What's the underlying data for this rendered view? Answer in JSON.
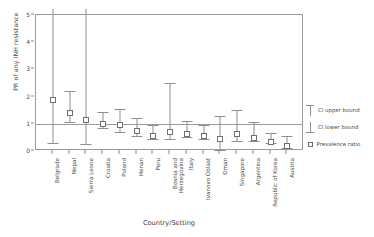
{
  "chart_data": {
    "type": "scatter",
    "title": "",
    "xlabel": "Country/Setting",
    "ylabel": "PR of any INH resistance",
    "ylim": [
      0,
      5
    ],
    "yticks": [
      0,
      1,
      2,
      3,
      4,
      5
    ],
    "grid": false,
    "reference_line": 1,
    "legend_position": "right",
    "categories": [
      "Belgrade",
      "Nepal",
      "Sierra Leone",
      "Croatia",
      "Poland",
      "Henan",
      "Peru",
      "Bosnia and Herzegovina",
      "Italy",
      "Ivanovo Oblast",
      "Oman",
      "Singapore",
      "Argentina",
      "Republic of Korea",
      "Austria"
    ],
    "series": [
      {
        "name": "Prevalence ratio",
        "values": [
          2.0,
          1.5,
          1.25,
          1.1,
          1.05,
          0.85,
          0.65,
          0.8,
          0.75,
          0.65,
          0.55,
          0.75,
          0.6,
          0.45,
          0.3
        ],
        "ci_lower": [
          0.3,
          1.05,
          0.25,
          0.85,
          0.7,
          0.55,
          0.45,
          0.45,
          0.5,
          0.45,
          0.05,
          0.35,
          0.35,
          0.3,
          0.1
        ],
        "ci_upper": [
          5.6,
          2.2,
          5.6,
          1.45,
          1.55,
          1.2,
          0.95,
          2.5,
          1.1,
          0.95,
          1.3,
          1.5,
          1.05,
          0.65,
          0.55
        ]
      }
    ],
    "legend": [
      {
        "label": "CI upper bound",
        "glyph": "whisker-upper"
      },
      {
        "label": "CI lower bound",
        "glyph": "whisker-lower"
      },
      {
        "label": "Prevalence ratio",
        "glyph": "open-square"
      }
    ],
    "colors": {
      "marker_stroke": "#6f6f6f",
      "whisker": "#8e8e8e",
      "axis": "#9a9a9a",
      "text": "#4a4a4a",
      "background": "#ffffff"
    }
  }
}
